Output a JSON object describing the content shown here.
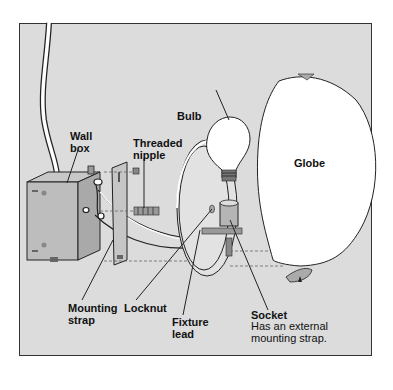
{
  "diagram": {
    "labels": {
      "wall_box": "Wall\nbox",
      "threaded_nipple": "Threaded\nnipple",
      "bulb": "Bulb",
      "globe": "Globe",
      "mounting_strap": "Mounting\nstrap",
      "locknut": "Locknut",
      "fixture_lead": "Fixture\nlead",
      "socket": "Socket",
      "socket_note": "Has an external\nmounting strap."
    },
    "colors": {
      "background": "#dcdcdc",
      "frame_border": "#333333",
      "metal": "#b9b9b9",
      "white_parts": "#ffffff",
      "outline": "#222222"
    }
  }
}
